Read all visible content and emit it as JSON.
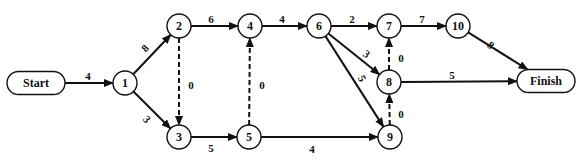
{
  "diagram": {
    "type": "activity-network",
    "terminals": [
      {
        "id": "start",
        "label": "Start",
        "x": 36,
        "y": 83,
        "w": 58,
        "h": 23
      },
      {
        "id": "finish",
        "label": "Finish",
        "x": 546,
        "y": 81,
        "w": 58,
        "h": 23
      }
    ],
    "nodes": [
      {
        "id": "1",
        "label": "1",
        "x": 125,
        "y": 83
      },
      {
        "id": "2",
        "label": "2",
        "x": 179,
        "y": 26
      },
      {
        "id": "3",
        "label": "3",
        "x": 179,
        "y": 137
      },
      {
        "id": "4",
        "label": "4",
        "x": 250,
        "y": 26
      },
      {
        "id": "5",
        "label": "5",
        "x": 249,
        "y": 137
      },
      {
        "id": "6",
        "label": "6",
        "x": 319,
        "y": 26
      },
      {
        "id": "7",
        "label": "7",
        "x": 389,
        "y": 26
      },
      {
        "id": "8",
        "label": "8",
        "x": 389,
        "y": 82
      },
      {
        "id": "9",
        "label": "9",
        "x": 390,
        "y": 137
      },
      {
        "id": "10",
        "label": "10",
        "x": 458,
        "y": 26
      }
    ],
    "edges": [
      {
        "from": "start",
        "to": "1",
        "weight": "4",
        "dashed": false,
        "lx": 88,
        "ly": 77,
        "rot": 0
      },
      {
        "from": "1",
        "to": "2",
        "weight": "8",
        "dashed": false,
        "lx": 146,
        "ly": 49,
        "rot": -47
      },
      {
        "from": "1",
        "to": "3",
        "weight": "3",
        "dashed": false,
        "lx": 146,
        "ly": 120,
        "rot": 47
      },
      {
        "from": "2",
        "to": "3",
        "weight": "0",
        "dashed": true,
        "lx": 191,
        "ly": 86,
        "rot": 0
      },
      {
        "from": "2",
        "to": "4",
        "weight": "6",
        "dashed": false,
        "lx": 211,
        "ly": 20,
        "rot": 0
      },
      {
        "from": "3",
        "to": "5",
        "weight": "5",
        "dashed": false,
        "lx": 211,
        "ly": 149,
        "rot": 0
      },
      {
        "from": "5",
        "to": "4",
        "weight": "0",
        "dashed": true,
        "lx": 262,
        "ly": 86,
        "rot": 0
      },
      {
        "from": "4",
        "to": "6",
        "weight": "4",
        "dashed": false,
        "lx": 282,
        "ly": 20,
        "rot": 0
      },
      {
        "from": "5",
        "to": "9",
        "weight": "4",
        "dashed": false,
        "lx": 312,
        "ly": 150,
        "rot": 0
      },
      {
        "from": "6",
        "to": "7",
        "weight": "2",
        "dashed": false,
        "lx": 352,
        "ly": 20,
        "rot": 0
      },
      {
        "from": "6",
        "to": "8",
        "weight": "3",
        "dashed": false,
        "lx": 366,
        "ly": 55,
        "rot": 35
      },
      {
        "from": "6",
        "to": "9",
        "weight": "5",
        "dashed": false,
        "lx": 361,
        "ly": 79,
        "rot": 62
      },
      {
        "from": "8",
        "to": "7",
        "weight": "0",
        "dashed": true,
        "lx": 401,
        "ly": 59,
        "rot": 0
      },
      {
        "from": "9",
        "to": "8",
        "weight": "0",
        "dashed": true,
        "lx": 401,
        "ly": 115,
        "rot": 0
      },
      {
        "from": "7",
        "to": "10",
        "weight": "7",
        "dashed": false,
        "lx": 422,
        "ly": 20,
        "rot": 0
      },
      {
        "from": "10",
        "to": "finish",
        "weight": "8",
        "dashed": false,
        "lx": 490,
        "ly": 46,
        "rot": 40
      },
      {
        "from": "8",
        "to": "finish",
        "weight": "5",
        "dashed": false,
        "lx": 452,
        "ly": 76,
        "rot": 0
      }
    ],
    "node_radius": 12,
    "colors": {
      "stroke": "#111111",
      "fill": "#ffffff",
      "background": "#ffffff"
    }
  }
}
